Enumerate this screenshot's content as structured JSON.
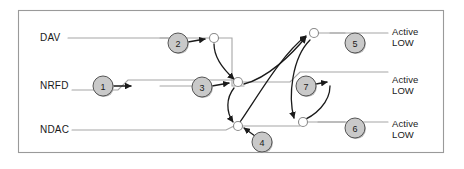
{
  "diagram": {
    "frame": {
      "x": 18,
      "y": 10,
      "width": 426,
      "height": 143,
      "border_color": "#9a9a9a",
      "background": "#ffffff"
    },
    "colors": {
      "signal_line": "#a6a6a6",
      "causal_arrow": "#1a1a1a",
      "marker_fill": "#c9c9c9",
      "marker_stroke": "#555555",
      "bubble_fill": "#ffffff",
      "bubble_stroke": "#8a8a8a",
      "text": "#1a1a1a"
    },
    "signals": [
      {
        "name": "DAV",
        "label": "DAV",
        "label_x": 40,
        "label_y": 32,
        "line_y": 38
      },
      {
        "name": "NRFD",
        "label": "NRFD",
        "label_x": 40,
        "label_y": 80,
        "line_y": 86
      },
      {
        "name": "NDAC",
        "label": "NDAC",
        "label_x": 40,
        "label_y": 124,
        "line_y": 130
      }
    ],
    "outputs": [
      {
        "id": "out-dav",
        "line1": "Active",
        "line2": "LOW",
        "x": 390,
        "y": 26
      },
      {
        "id": "out-nrfd",
        "line1": "Active",
        "line2": "LOW",
        "x": 390,
        "y": 74
      },
      {
        "id": "out-ndac",
        "line1": "Active",
        "line2": "LOW",
        "x": 390,
        "y": 118
      }
    ],
    "markers": [
      {
        "id": 1,
        "label": "1",
        "cx": 103,
        "cy": 86,
        "r": 10
      },
      {
        "id": 2,
        "label": "2",
        "cx": 178,
        "cy": 43,
        "r": 10
      },
      {
        "id": 3,
        "label": "3",
        "cx": 202,
        "cy": 87,
        "r": 10
      },
      {
        "id": 4,
        "label": "4",
        "cx": 262,
        "cy": 142,
        "r": 10
      },
      {
        "id": 5,
        "label": "5",
        "cx": 355,
        "cy": 43,
        "r": 10
      },
      {
        "id": 6,
        "label": "6",
        "cx": 355,
        "cy": 128,
        "r": 10
      },
      {
        "id": 7,
        "label": "7",
        "cx": 306,
        "cy": 86,
        "r": 10
      }
    ],
    "bubbles": [
      {
        "id": "bubble-dav-transition",
        "cx": 214,
        "cy": 38,
        "r": 4.5
      },
      {
        "id": "bubble-nrfd-mid",
        "cx": 238,
        "cy": 82,
        "r": 4.5
      },
      {
        "id": "bubble-ndac-mid",
        "cx": 238,
        "cy": 126,
        "r": 4.5
      },
      {
        "id": "bubble-dav-out",
        "cx": 314,
        "cy": 33,
        "r": 4.5
      },
      {
        "id": "bubble-ndac-out",
        "cx": 303,
        "cy": 122,
        "r": 4.5
      }
    ]
  }
}
